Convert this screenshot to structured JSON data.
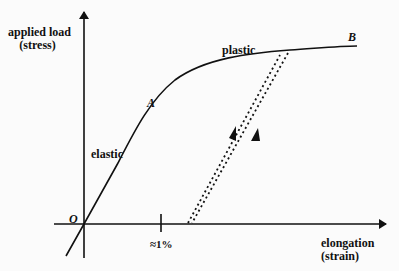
{
  "diagram": {
    "type": "stress-strain curve",
    "y_axis": {
      "label_line1": "applied load",
      "label_line2": "(stress)"
    },
    "x_axis": {
      "label_line1": "elongation",
      "label_line2": "(strain)"
    },
    "origin_label": "O",
    "tick_label": "≈1%",
    "regions": {
      "elastic": "elastic",
      "plastic": "plastic"
    },
    "points": {
      "A": "A",
      "B": "B"
    },
    "colors": {
      "ink": "#111111",
      "background": "#fbfbfb"
    }
  }
}
